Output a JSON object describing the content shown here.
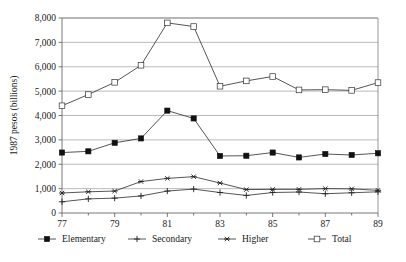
{
  "figure": {
    "caption_fragment": "",
    "background": "#ffffff"
  },
  "chart_data": {
    "type": "line",
    "title": "",
    "subtitle": "",
    "xlabel": "",
    "ylabel": "1987 pesos (billions)",
    "ylim": [
      0,
      8000
    ],
    "ytick_labels": [
      "0",
      "1,000",
      "2,000",
      "3,000",
      "4,000",
      "5,000",
      "6,000",
      "7,000",
      "8,000"
    ],
    "ytick_values": [
      0,
      1000,
      2000,
      3000,
      4000,
      5000,
      6000,
      7000,
      8000
    ],
    "grid": true,
    "grid_axis": "y",
    "legend_position": "bottom",
    "x": [
      77,
      78,
      79,
      80,
      81,
      82,
      83,
      84,
      85,
      86,
      87,
      88,
      89
    ],
    "xtick_labels": [
      "77",
      "79",
      "81",
      "83",
      "85",
      "87",
      "89"
    ],
    "xtick_values": [
      77,
      79,
      81,
      83,
      85,
      87,
      89
    ],
    "x_all_labels": [
      "77",
      "78",
      "79",
      "80",
      "81",
      "82",
      "83",
      "84",
      "85",
      "86",
      "87",
      "88",
      "89"
    ],
    "series": [
      {
        "name": "Elementary",
        "marker": "filled-square",
        "color": "#111111",
        "values": [
          2480,
          2530,
          2880,
          3060,
          4200,
          3880,
          2340,
          2350,
          2480,
          2280,
          2420,
          2380,
          2450
        ]
      },
      {
        "name": "Secondary",
        "marker": "plus",
        "color": "#222222",
        "values": [
          460,
          580,
          610,
          700,
          900,
          980,
          840,
          720,
          840,
          860,
          790,
          830,
          870
        ]
      },
      {
        "name": "Higher",
        "marker": "asterisk",
        "color": "#222222",
        "values": [
          820,
          870,
          900,
          1290,
          1420,
          1490,
          1230,
          960,
          970,
          970,
          1000,
          990,
          930
        ]
      },
      {
        "name": "Total",
        "marker": "open-square",
        "color": "#333333",
        "values": [
          4400,
          4860,
          5360,
          6060,
          7800,
          7650,
          5200,
          5420,
          5600,
          5050,
          5060,
          5030,
          5350
        ]
      }
    ],
    "legend": [
      {
        "label": "Elementary",
        "marker": "filled-square"
      },
      {
        "label": "Secondary",
        "marker": "plus"
      },
      {
        "label": "Higher",
        "marker": "asterisk"
      },
      {
        "label": "Total",
        "marker": "open-square"
      }
    ]
  }
}
